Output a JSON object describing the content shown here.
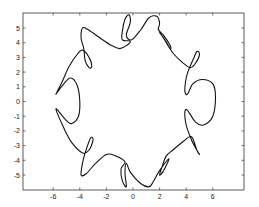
{
  "chart_data": {
    "type": "line",
    "title": "",
    "xlabel": "",
    "ylabel": "",
    "xlim": [
      -7.2,
      9.5
    ],
    "ylim": [
      -5.9,
      5.9
    ],
    "grid": false,
    "legend": null,
    "x_ticks": [
      -6,
      -4,
      -2,
      0,
      2,
      4,
      6
    ],
    "x_tick_labels": [
      "-6",
      "-4",
      "-2",
      "0",
      "2",
      "4",
      "6"
    ],
    "y_ticks": [
      5,
      4,
      3,
      2,
      1,
      0,
      -1,
      -2,
      -3,
      -4,
      -5
    ],
    "y_tick_labels": [
      "5",
      "4",
      "3",
      "2",
      "1",
      "0",
      "-1",
      "-2",
      "-3",
      "-4",
      "-5"
    ],
    "series": [
      {
        "name": "closed curve with loops",
        "color": "#111111",
        "points": [
          [
            -5.8,
            0.5
          ],
          [
            -5.3,
            1.4
          ],
          [
            -4.8,
            2.4
          ],
          [
            -4.2,
            3.2
          ],
          [
            -3.8,
            3.5
          ],
          [
            -3.3,
            3.0
          ],
          [
            -3.1,
            2.4
          ],
          [
            -3.3,
            2.3
          ],
          [
            -3.6,
            2.8
          ],
          [
            -3.7,
            3.6
          ],
          [
            -3.9,
            4.3
          ],
          [
            -3.8,
            5.0
          ],
          [
            -3.4,
            4.9
          ],
          [
            -2.6,
            4.4
          ],
          [
            -1.6,
            3.8
          ],
          [
            -1.0,
            3.6
          ],
          [
            -0.5,
            3.8
          ],
          [
            -0.2,
            4.1
          ],
          [
            -0.8,
            4.2
          ],
          [
            -0.8,
            4.8
          ],
          [
            -0.6,
            5.6
          ],
          [
            -0.3,
            5.9
          ],
          [
            -0.2,
            5.4
          ],
          [
            -0.5,
            4.5
          ],
          [
            -0.1,
            4.2
          ],
          [
            0.6,
            4.9
          ],
          [
            1.2,
            5.7
          ],
          [
            1.8,
            5.8
          ],
          [
            2.0,
            5.3
          ],
          [
            1.9,
            4.9
          ],
          [
            2.3,
            4.5
          ],
          [
            2.8,
            3.8
          ],
          [
            2.8,
            3.6
          ],
          [
            2.4,
            4.2
          ],
          [
            2.0,
            4.7
          ],
          [
            2.3,
            4.3
          ],
          [
            3.0,
            3.3
          ],
          [
            3.8,
            2.6
          ],
          [
            4.3,
            2.3
          ],
          [
            4.7,
            2.6
          ],
          [
            5.0,
            3.2
          ],
          [
            4.8,
            3.4
          ],
          [
            4.5,
            2.8
          ],
          [
            4.2,
            2.2
          ],
          [
            4.0,
            1.6
          ],
          [
            3.9,
            0.7
          ],
          [
            4.1,
            0.5
          ],
          [
            4.5,
            1.2
          ],
          [
            5.2,
            1.5
          ],
          [
            6.0,
            1.2
          ],
          [
            6.2,
            0.3
          ],
          [
            6.0,
            -1.0
          ],
          [
            5.3,
            -1.6
          ],
          [
            4.7,
            -1.4
          ],
          [
            4.1,
            -0.6
          ],
          [
            3.9,
            -0.7
          ],
          [
            4.0,
            -1.6
          ],
          [
            4.3,
            -2.4
          ],
          [
            4.6,
            -3.0
          ],
          [
            5.0,
            -3.6
          ],
          [
            4.8,
            -3.3
          ],
          [
            4.4,
            -2.4
          ],
          [
            3.8,
            -2.7
          ],
          [
            3.0,
            -3.3
          ],
          [
            2.5,
            -3.7
          ],
          [
            2.2,
            -4.4
          ],
          [
            2.0,
            -5.0
          ],
          [
            2.3,
            -4.7
          ],
          [
            2.7,
            -3.9
          ],
          [
            2.0,
            -4.7
          ],
          [
            1.5,
            -5.5
          ],
          [
            1.2,
            -5.8
          ],
          [
            0.6,
            -5.6
          ],
          [
            -0.2,
            -4.8
          ],
          [
            -0.5,
            -4.2
          ],
          [
            -0.6,
            -4.9
          ],
          [
            -0.5,
            -5.8
          ],
          [
            -0.8,
            -5.4
          ],
          [
            -0.9,
            -4.6
          ],
          [
            -0.6,
            -4.1
          ],
          [
            -1.3,
            -3.7
          ],
          [
            -2.0,
            -3.6
          ],
          [
            -2.8,
            -4.2
          ],
          [
            -3.5,
            -4.9
          ],
          [
            -3.9,
            -5.0
          ],
          [
            -3.8,
            -4.2
          ],
          [
            -3.6,
            -3.5
          ],
          [
            -3.2,
            -2.5
          ],
          [
            -3.0,
            -2.6
          ],
          [
            -3.3,
            -3.3
          ],
          [
            -3.8,
            -3.5
          ],
          [
            -4.6,
            -2.8
          ],
          [
            -5.2,
            -1.8
          ],
          [
            -5.8,
            -0.5
          ],
          [
            -5.0,
            -1.3
          ],
          [
            -4.6,
            -1.5
          ],
          [
            -4.1,
            -1.0
          ],
          [
            -4.0,
            0.0
          ],
          [
            -4.2,
            1.1
          ],
          [
            -4.7,
            1.6
          ],
          [
            -5.2,
            1.2
          ],
          [
            -5.8,
            0.5
          ]
        ]
      }
    ]
  },
  "plot": {
    "frame": {
      "left": 23,
      "top": 13,
      "right": 244,
      "bottom": 190
    },
    "x_origin_px": 133,
    "y_origin_px": 101.5,
    "x_unit_px": 13.3,
    "y_unit_px": 14.7
  }
}
